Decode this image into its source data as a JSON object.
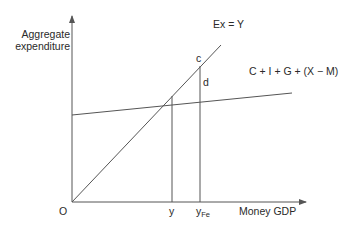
{
  "diagram": {
    "type": "Keynesian cross",
    "y_axis_label_line1": "Aggregate",
    "y_axis_label_line2": "expenditure",
    "x_axis_label": "Money GDP",
    "origin_label": "O",
    "line_45_label": "Ex = Y",
    "ae_line_label": "C + I + G + (X − M)",
    "point_c_label": "c",
    "point_d_label": "d",
    "x_tick_y_label": "y",
    "x_tick_yfe_main": "y",
    "x_tick_yfe_sub": "Fe",
    "line_color": "#555555"
  }
}
